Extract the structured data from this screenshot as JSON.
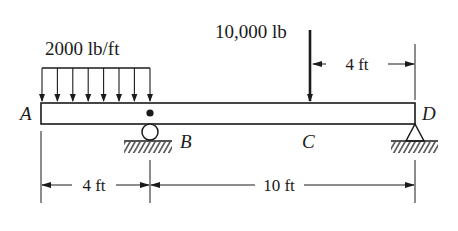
{
  "diagram": {
    "type": "beam-free-body",
    "distributed_load": {
      "label": "2000 lb/ft",
      "from_point": "A",
      "to_point": "B",
      "arrow_count": 8
    },
    "point_load": {
      "label": "10,000 lb",
      "at_point": "C"
    },
    "points": {
      "A": "A",
      "B": "B",
      "C": "C",
      "D": "D"
    },
    "supports": [
      {
        "point": "B",
        "type": "roller"
      },
      {
        "point": "D",
        "type": "pin"
      }
    ],
    "dimensions": {
      "top_right": "4 ft",
      "bottom_left": "4 ft",
      "bottom_right": "10 ft"
    },
    "colors": {
      "ink": "#1a1a1a",
      "background": "#ffffff"
    }
  }
}
